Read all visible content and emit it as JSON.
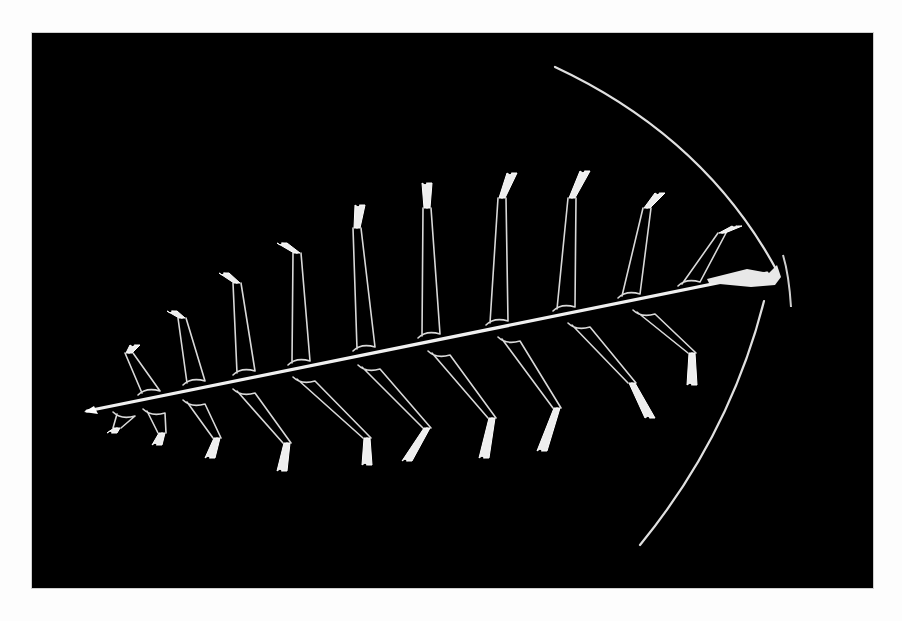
{
  "image": {
    "kind": "photograph",
    "subject": "feather-like skeletal specimen on black background",
    "background_color": "#000000",
    "border_color": "#fdfdfd",
    "subject_color": "#e6e6e6",
    "frame": {
      "x": 32,
      "y": 33,
      "width": 841,
      "height": 555
    }
  },
  "specimen": {
    "rachis": {
      "x1": 55,
      "y1": 378,
      "x2": 735,
      "y2": 240
    },
    "head": {
      "x": 715,
      "y": 242
    },
    "upper_arm": {
      "start": [
        523,
        34
      ],
      "end": [
        745,
        238
      ]
    },
    "lower_arm": {
      "start": [
        608,
        512
      ],
      "end": [
        732,
        268
      ]
    },
    "upper_branches": [
      {
        "bx": 120,
        "by": 366,
        "tx": 97,
        "ty": 320,
        "tipx": 103,
        "tipy": 312
      },
      {
        "bx": 165,
        "by": 356,
        "tx": 150,
        "ty": 285,
        "tipx": 140,
        "tipy": 278
      },
      {
        "bx": 215,
        "by": 346,
        "tx": 205,
        "ty": 250,
        "tipx": 192,
        "tipy": 240
      },
      {
        "bx": 270,
        "by": 336,
        "tx": 265,
        "ty": 220,
        "tipx": 250,
        "tipy": 210
      },
      {
        "bx": 335,
        "by": 322,
        "tx": 325,
        "ty": 195,
        "tipx": 328,
        "tipy": 172
      },
      {
        "bx": 400,
        "by": 309,
        "tx": 395,
        "ty": 175,
        "tipx": 395,
        "tipy": 150
      },
      {
        "bx": 468,
        "by": 296,
        "tx": 470,
        "ty": 165,
        "tipx": 480,
        "tipy": 140
      },
      {
        "bx": 535,
        "by": 282,
        "tx": 540,
        "ty": 165,
        "tipx": 553,
        "tipy": 138
      },
      {
        "bx": 600,
        "by": 269,
        "tx": 615,
        "ty": 175,
        "tipx": 628,
        "tipy": 160
      },
      {
        "bx": 660,
        "by": 257,
        "tx": 690,
        "ty": 200,
        "tipx": 705,
        "tipy": 193
      }
    ],
    "lower_branches": [
      {
        "bx": 95,
        "by": 375,
        "tx": 85,
        "ty": 395,
        "tipx": 80,
        "tipy": 400
      },
      {
        "bx": 125,
        "by": 372,
        "tx": 130,
        "ty": 400,
        "tipx": 125,
        "tipy": 412
      },
      {
        "bx": 165,
        "by": 363,
        "tx": 185,
        "ty": 405,
        "tipx": 178,
        "tipy": 425
      },
      {
        "bx": 215,
        "by": 352,
        "tx": 255,
        "ty": 410,
        "tipx": 250,
        "tipy": 438
      },
      {
        "bx": 275,
        "by": 340,
        "tx": 335,
        "ty": 405,
        "tipx": 335,
        "tipy": 432
      },
      {
        "bx": 340,
        "by": 328,
        "tx": 395,
        "ty": 395,
        "tipx": 375,
        "tipy": 428
      },
      {
        "bx": 410,
        "by": 314,
        "tx": 460,
        "ty": 385,
        "tipx": 452,
        "tipy": 425
      },
      {
        "bx": 480,
        "by": 300,
        "tx": 525,
        "ty": 375,
        "tipx": 510,
        "tipy": 418
      },
      {
        "bx": 550,
        "by": 286,
        "tx": 600,
        "ty": 350,
        "tipx": 618,
        "tipy": 385
      },
      {
        "bx": 615,
        "by": 273,
        "tx": 660,
        "ty": 320,
        "tipx": 660,
        "tipy": 352
      }
    ]
  }
}
